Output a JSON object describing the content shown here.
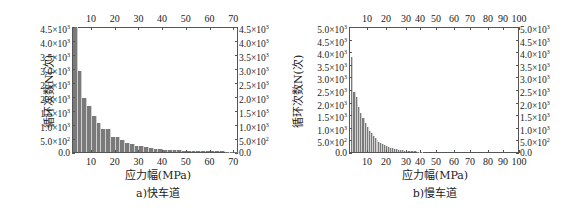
{
  "chart_data": [
    {
      "id": "a",
      "type": "bar",
      "caption": "a)快车道",
      "xlabel": "应力幅(MPa)",
      "ylabel": "循环次数N(次)",
      "xlim": [
        2,
        72
      ],
      "ylim": [
        0,
        4500
      ],
      "x_ticks": [
        10,
        20,
        30,
        40,
        50,
        60,
        70
      ],
      "y_ticks": [
        "0.0",
        "5.0×10²",
        "1.0×10³",
        "1.5×10³",
        "2.0×10³",
        "2.5×10³",
        "3.0×10³",
        "3.5×10³",
        "4.0×10³",
        "4.5×10³"
      ],
      "y_tick_values": [
        0,
        500,
        1000,
        1500,
        2000,
        2500,
        3000,
        3500,
        4000,
        4500
      ],
      "bin_width": 2,
      "x": [
        3,
        5,
        7,
        9,
        11,
        13,
        15,
        17,
        19,
        21,
        23,
        25,
        27,
        29,
        31,
        33,
        35,
        37,
        39,
        41,
        43,
        45,
        47,
        49,
        51,
        53,
        55,
        57,
        59,
        61,
        63,
        65,
        67,
        69,
        71
      ],
      "values": [
        4500,
        2900,
        1950,
        1650,
        1300,
        1050,
        820,
        820,
        540,
        540,
        420,
        330,
        280,
        230,
        200,
        170,
        140,
        110,
        95,
        80,
        70,
        60,
        55,
        50,
        45,
        40,
        35,
        30,
        28,
        25,
        22,
        20,
        18,
        16,
        15
      ],
      "grid": false,
      "mirrored_axes": true
    },
    {
      "id": "b",
      "type": "bar",
      "caption": "b)慢车道",
      "xlabel": "应力幅(MPa)",
      "ylabel": "循环次数N(次)",
      "xlim": [
        2,
        100
      ],
      "ylim": [
        0,
        5000
      ],
      "x_ticks": [
        10,
        20,
        30,
        40,
        50,
        60,
        70,
        80,
        90,
        100
      ],
      "y_ticks": [
        "0.0",
        "5.0×10²",
        "1.0×10³",
        "1.5×10³",
        "2.0×10³",
        "2.5×10³",
        "3.0×10³",
        "3.5×10³",
        "4.0×10³",
        "4.5×10³",
        "5.0×10³"
      ],
      "y_tick_values": [
        0,
        500,
        1000,
        1500,
        2000,
        2500,
        3000,
        3500,
        4000,
        4500,
        5000
      ],
      "bin_width": 1,
      "x": [
        3,
        4,
        5,
        6,
        7,
        8,
        9,
        10,
        11,
        12,
        13,
        14,
        15,
        16,
        17,
        18,
        19,
        20,
        21,
        22,
        23,
        24,
        25,
        26,
        27,
        28,
        29,
        30,
        32,
        34,
        36,
        38,
        40
      ],
      "values": [
        3800,
        2400,
        2200,
        1800,
        1550,
        1350,
        1150,
        1000,
        850,
        750,
        650,
        560,
        480,
        420,
        360,
        310,
        270,
        230,
        200,
        170,
        150,
        130,
        110,
        95,
        80,
        70,
        60,
        50,
        40,
        30,
        25,
        18,
        12
      ],
      "grid": false,
      "mirrored_axes": true
    }
  ]
}
